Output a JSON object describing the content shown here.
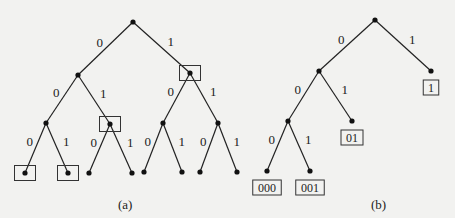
{
  "diagram": {
    "tree_a": {
      "caption": "(a)",
      "nodes": [
        {
          "id": "r",
          "x": 133,
          "y": 22
        },
        {
          "id": "n0",
          "x": 78,
          "y": 75
        },
        {
          "id": "n1",
          "x": 190,
          "y": 73,
          "boxed": true
        },
        {
          "id": "n00",
          "x": 46,
          "y": 123
        },
        {
          "id": "n01",
          "x": 110,
          "y": 124,
          "boxed": true
        },
        {
          "id": "n10",
          "x": 163,
          "y": 123
        },
        {
          "id": "n11",
          "x": 218,
          "y": 123
        },
        {
          "id": "n000",
          "x": 25,
          "y": 173,
          "boxed": true
        },
        {
          "id": "n001",
          "x": 68,
          "y": 173,
          "boxed": true
        },
        {
          "id": "n010",
          "x": 89,
          "y": 173
        },
        {
          "id": "n011",
          "x": 132,
          "y": 173
        },
        {
          "id": "n100",
          "x": 144,
          "y": 172
        },
        {
          "id": "n101",
          "x": 182,
          "y": 172
        },
        {
          "id": "n110",
          "x": 200,
          "y": 172
        },
        {
          "id": "n111",
          "x": 237,
          "y": 172
        }
      ],
      "edges": [
        {
          "from": "r",
          "to": "n0",
          "label": "0"
        },
        {
          "from": "r",
          "to": "n1",
          "label": "1"
        },
        {
          "from": "n0",
          "to": "n00",
          "label": "0"
        },
        {
          "from": "n0",
          "to": "n01",
          "label": "1"
        },
        {
          "from": "n1",
          "to": "n10",
          "label": "0"
        },
        {
          "from": "n1",
          "to": "n11",
          "label": "1"
        },
        {
          "from": "n00",
          "to": "n000",
          "label": "0"
        },
        {
          "from": "n00",
          "to": "n001",
          "label": "1"
        },
        {
          "from": "n01",
          "to": "n010",
          "label": "0"
        },
        {
          "from": "n01",
          "to": "n011",
          "label": "1"
        },
        {
          "from": "n10",
          "to": "n100",
          "label": "0"
        },
        {
          "from": "n10",
          "to": "n101",
          "label": "1"
        },
        {
          "from": "n11",
          "to": "n110",
          "label": "0"
        },
        {
          "from": "n11",
          "to": "n111",
          "label": "1"
        }
      ]
    },
    "tree_b": {
      "caption": "(b)",
      "nodes": [
        {
          "id": "r",
          "x": 375,
          "y": 20
        },
        {
          "id": "n0",
          "x": 319,
          "y": 71
        },
        {
          "id": "n1",
          "x": 431,
          "y": 71,
          "code": "1"
        },
        {
          "id": "n00",
          "x": 288,
          "y": 121
        },
        {
          "id": "n01",
          "x": 352,
          "y": 121,
          "code": "01"
        },
        {
          "id": "n000",
          "x": 267,
          "y": 171,
          "code": "000"
        },
        {
          "id": "n001",
          "x": 310,
          "y": 171,
          "code": "001"
        }
      ],
      "edges": [
        {
          "from": "r",
          "to": "n0",
          "label": "0"
        },
        {
          "from": "r",
          "to": "n1",
          "label": "1"
        },
        {
          "from": "n0",
          "to": "n00",
          "label": "0"
        },
        {
          "from": "n0",
          "to": "n01",
          "label": "1"
        },
        {
          "from": "n00",
          "to": "n000",
          "label": "0"
        },
        {
          "from": "n00",
          "to": "n001",
          "label": "1"
        }
      ]
    }
  }
}
